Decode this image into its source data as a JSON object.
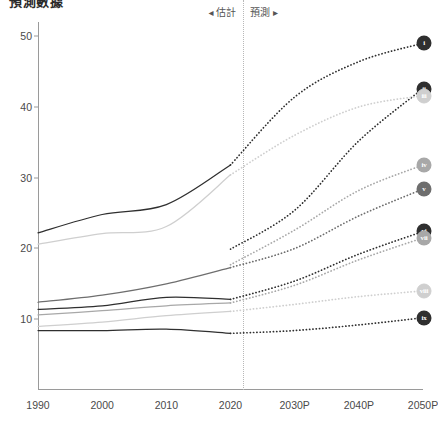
{
  "title": "預測數據",
  "annotations": {
    "estimate_label": "◂ 估計",
    "forecast_label": "預測 ▸",
    "divider_year": 2022
  },
  "colors": {
    "axis": "#9a9a9a",
    "divider": "#b8b8b8",
    "text": "#4a4a4a",
    "dark": "#2f2f2f",
    "mid": "#6e6e6e",
    "light": "#a8a8a8",
    "pale": "#cfcfcf"
  },
  "chart_data": {
    "type": "line",
    "title": "預測數據",
    "xlabel": "",
    "ylabel": "",
    "grid": false,
    "legend": "none",
    "x": [
      1990,
      2000,
      2010,
      2020,
      2030,
      2040,
      2050
    ],
    "xticklabels": [
      "1990",
      "2000",
      "2010",
      "2020",
      "2030P",
      "2040P",
      "2050P"
    ],
    "yticklabels": [
      "10",
      "20",
      "30",
      "40",
      "50"
    ],
    "yticks": [
      10,
      20,
      30,
      40,
      50
    ],
    "ylim": [
      0,
      52
    ],
    "xlim": [
      1990,
      2050
    ],
    "history_end": 2020,
    "series": [
      {
        "name": "i",
        "label": "i",
        "color": "#2f2f2f",
        "end_value": 49.0,
        "history": [
          22.2,
          24.8,
          26.2,
          31.8
        ],
        "forecast": [
          31.8,
          41.4,
          46.4,
          49.0
        ]
      },
      {
        "name": "ii",
        "label": "ii",
        "color": "#2f2f2f",
        "end_value": 42.6,
        "history": [
          null,
          null,
          null,
          19.9
        ],
        "forecast": [
          19.9,
          25.4,
          35.2,
          42.6
        ]
      },
      {
        "name": "iii",
        "label": "iii",
        "color": "#cfcfcf",
        "end_value": 41.6,
        "history": [
          20.6,
          22.1,
          23.1,
          30.4
        ],
        "forecast": [
          30.4,
          36.0,
          40.0,
          41.6
        ]
      },
      {
        "name": "iv",
        "label": "iv",
        "color": "#a8a8a8",
        "end_value": 31.8,
        "history": [
          null,
          null,
          null,
          17.7
        ],
        "forecast": [
          17.7,
          22.6,
          28.2,
          31.8
        ]
      },
      {
        "name": "v",
        "label": "v",
        "color": "#6e6e6e",
        "end_value": 28.4,
        "history": [
          12.4,
          13.4,
          15.0,
          17.3
        ],
        "forecast": [
          17.3,
          20.0,
          24.6,
          28.4
        ]
      },
      {
        "name": "vi",
        "label": "vi",
        "color": "#2f2f2f",
        "end_value": 22.4,
        "history": [
          11.4,
          11.9,
          13.1,
          12.8
        ],
        "forecast": [
          12.8,
          15.4,
          19.2,
          22.4
        ]
      },
      {
        "name": "vii",
        "label": "vii",
        "color": "#a8a8a8",
        "end_value": 21.5,
        "history": [
          10.6,
          11.2,
          11.9,
          12.3
        ],
        "forecast": [
          12.3,
          14.8,
          18.4,
          21.5
        ]
      },
      {
        "name": "viii",
        "label": "viii",
        "color": "#cfcfcf",
        "end_value": 14.0,
        "history": [
          9.0,
          9.6,
          10.5,
          11.1
        ],
        "forecast": [
          11.1,
          12.1,
          13.2,
          14.0
        ]
      },
      {
        "name": "ix",
        "label": "ix",
        "color": "#2f2f2f",
        "end_value": 10.2,
        "history": [
          8.4,
          8.4,
          8.6,
          8.0
        ],
        "forecast": [
          8.0,
          8.4,
          9.2,
          10.2
        ]
      }
    ]
  }
}
